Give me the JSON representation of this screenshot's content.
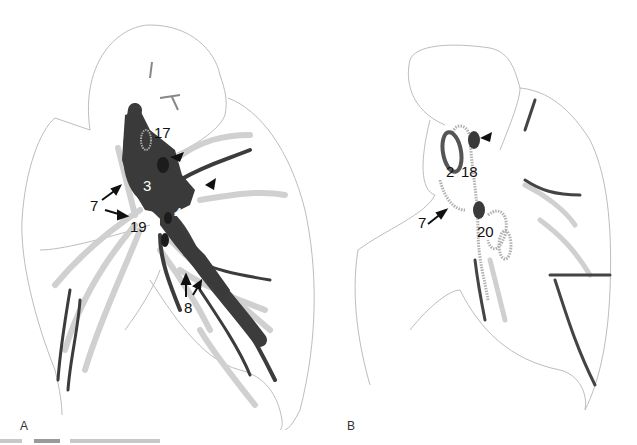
{
  "figure": {
    "panels": [
      {
        "id": "A",
        "label": "A",
        "labels": [
          {
            "text": "17",
            "color": "dark"
          },
          {
            "text": "3",
            "color": "white"
          },
          {
            "text": "4",
            "color": "white"
          },
          {
            "text": "7",
            "color": "dark"
          },
          {
            "text": "19",
            "color": "dark"
          },
          {
            "text": "8",
            "color": "dark"
          }
        ],
        "arrowheads": 2,
        "arrows": 4
      },
      {
        "id": "B",
        "label": "B",
        "labels": [
          {
            "text": "2",
            "color": "dark"
          },
          {
            "text": "18",
            "color": "dark"
          },
          {
            "text": "7",
            "color": "dark"
          },
          {
            "text": "20",
            "color": "dark"
          }
        ],
        "arrowheads": 1,
        "arrows": 1
      }
    ],
    "caption": {
      "visible": "partially cut off, illegible"
    },
    "colors": {
      "outline": "#bdbdbd",
      "dark_vessel": "#3c3c3c",
      "light_vessel": "#d4d4d4",
      "node": "#2a2a2a"
    }
  }
}
